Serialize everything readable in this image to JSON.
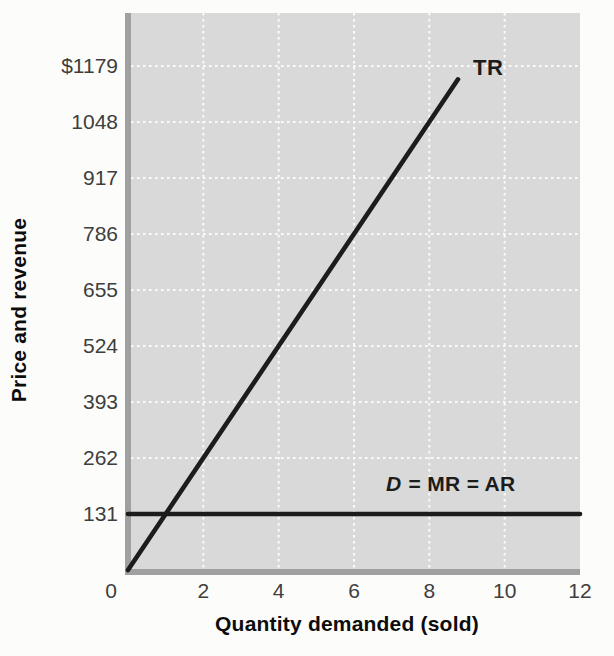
{
  "colors": {
    "page_background": "#fcfcfa",
    "plot_background": "#d9d9d9",
    "gridline": "#ffffff",
    "axis_band": "#a0a0a0",
    "series_line": "#1c1c1c",
    "tick_label": "#3e3e3e",
    "axis_title": "#0c0c0c"
  },
  "chart_data": {
    "type": "line",
    "title": "",
    "xlabel": "Quantity demanded (sold)",
    "ylabel": "Price and revenue",
    "xlim": [
      0,
      12
    ],
    "ylim": [
      0,
      1303
    ],
    "grid": true,
    "legend_position": "inline-labels",
    "x_ticks": [
      {
        "value": 0,
        "label": "0"
      },
      {
        "value": 2,
        "label": "2"
      },
      {
        "value": 4,
        "label": "4"
      },
      {
        "value": 6,
        "label": "6"
      },
      {
        "value": 8,
        "label": "8"
      },
      {
        "value": 10,
        "label": "10"
      },
      {
        "value": 12,
        "label": "12"
      }
    ],
    "y_ticks": [
      {
        "value": 1179,
        "label": "$1179"
      },
      {
        "value": 1048,
        "label": "1048"
      },
      {
        "value": 917,
        "label": "917"
      },
      {
        "value": 786,
        "label": "786"
      },
      {
        "value": 655,
        "label": "655"
      },
      {
        "value": 524,
        "label": "524"
      },
      {
        "value": 393,
        "label": "393"
      },
      {
        "value": 262,
        "label": "262"
      },
      {
        "value": 131,
        "label": "131"
      }
    ],
    "series": [
      {
        "name": "TR",
        "label": "TR",
        "points": [
          [
            0,
            0
          ],
          [
            8.76,
            1148
          ]
        ]
      },
      {
        "name": "D",
        "label_d": "D",
        "label_rest": " = MR = AR",
        "points": [
          [
            0,
            131
          ],
          [
            12,
            131
          ]
        ]
      }
    ]
  }
}
